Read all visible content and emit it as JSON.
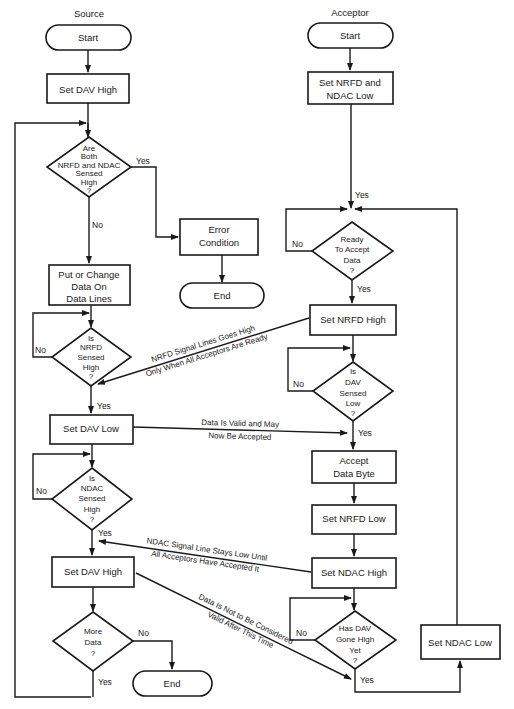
{
  "diagram": {
    "type": "flowchart",
    "lanes": {
      "source": {
        "title": "Source"
      },
      "acceptor": {
        "title": "Acceptor"
      }
    },
    "source": {
      "start": "Start",
      "set_dav_high_1": "Set DAV High",
      "check_both": [
        "Are",
        "Both",
        "NRFD and NDAC",
        "Sensed",
        "High",
        "?"
      ],
      "check_both_yes": "Yes",
      "check_both_no": "No",
      "error": [
        "Error",
        "Condition"
      ],
      "error_end": "End",
      "put_data": [
        "Put or Change",
        "Data On",
        "Data Lines"
      ],
      "check_nrfd": [
        "Is",
        "NRFD",
        "Sensed",
        "High",
        "?"
      ],
      "check_nrfd_no": "No",
      "check_nrfd_yes": "Yes",
      "set_dav_low": "Set DAV Low",
      "check_ndac": [
        "Is",
        "NDAC",
        "Sensed",
        "High",
        "?"
      ],
      "check_ndac_no": "No",
      "check_ndac_yes": "Yes",
      "set_dav_high_2": "Set DAV High",
      "more_data": [
        "More",
        "Data",
        "?"
      ],
      "more_data_no": "No",
      "more_data_yes": "Yes",
      "end": "End"
    },
    "acceptor": {
      "start": "Start",
      "set_nrfd_ndac_low": [
        "Set NRFD and",
        "NDAC Low"
      ],
      "entry_yes": "Yes",
      "ready": [
        "Ready",
        "To Accept",
        "Data",
        "?"
      ],
      "ready_no": "No",
      "ready_yes": "Yes",
      "set_nrfd_high": "Set NRFD High",
      "check_dav_low": [
        "Is",
        "DAV",
        "Sensed",
        "Low",
        "?"
      ],
      "check_dav_low_no": "No",
      "check_dav_low_yes": "Yes",
      "accept_byte": [
        "Accept",
        "Data Byte"
      ],
      "set_nrfd_low": "Set NRFD Low",
      "set_ndac_high": "Set NDAC High",
      "dav_high_yet": [
        "Has DAV",
        "Gone High",
        "Yet",
        "?"
      ],
      "dav_high_yet_no": "No",
      "dav_high_yet_yes": "Yes",
      "set_ndac_low": "Set NDAC Low"
    },
    "annotations": {
      "nrfd_signal": [
        "NRFD Signal Lines Goes High",
        "Only When All Acceptors Are Ready"
      ],
      "data_valid": [
        "Data Is Valid and May",
        "Now Be Accepted"
      ],
      "ndac_signal": [
        "NDAC Signal Line Stays Low Until",
        "All Acceptors Have Accepted It"
      ],
      "data_not_valid": [
        "Data Is Not to Be Considered",
        "Valid After This Time"
      ]
    }
  }
}
